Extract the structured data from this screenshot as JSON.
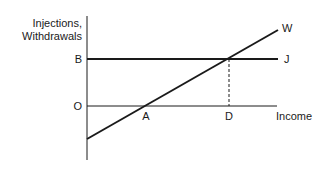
{
  "diagram": {
    "y_axis_label_line1": "Injections,",
    "y_axis_label_line2": "Withdrawals",
    "x_axis_label": "Income",
    "points": {
      "B": "B",
      "O": "O",
      "A": "A",
      "D": "D"
    },
    "lines": {
      "withdrawals": "W",
      "injections": "J"
    },
    "colors": {
      "ink": "#1a1a1a",
      "background": "#ffffff"
    }
  }
}
